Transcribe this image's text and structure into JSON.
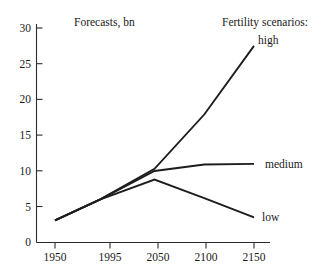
{
  "chart_data": {
    "type": "line",
    "title": "Forecasts, bn",
    "subtitle": "",
    "xlabel": "",
    "ylabel": "",
    "legend_heading": "Fertility scenarios:",
    "legend_position": "right-inline",
    "grid": false,
    "x": [
      1950,
      1995,
      2050,
      2100,
      2150
    ],
    "xlim": [
      1950,
      2150
    ],
    "ylim": [
      0,
      30
    ],
    "x_ticks": [
      1950,
      1995,
      2050,
      2100,
      2150
    ],
    "x_tick_labels": [
      "1950",
      "1995",
      "2050",
      "2100",
      "2150"
    ],
    "y_ticks": [
      0,
      5,
      10,
      15,
      20,
      25,
      30
    ],
    "y_tick_labels": [
      "0",
      "5",
      "10",
      "15",
      "20",
      "25",
      "30"
    ],
    "series": [
      {
        "name": "high",
        "label": "high",
        "color": "#1d1d1d",
        "x": [
          1950,
          1995,
          2050,
          2100,
          2150
        ],
        "values": [
          3.1,
          6.0,
          10.3,
          17.9,
          27.5
        ]
      },
      {
        "name": "medium",
        "label": "medium",
        "color": "#1d1d1d",
        "x": [
          1950,
          1995,
          2050,
          2100,
          2150
        ],
        "values": [
          3.1,
          6.0,
          10.0,
          10.9,
          11.0
        ]
      },
      {
        "name": "low",
        "label": "low",
        "color": "#1d1d1d",
        "x": [
          1950,
          1995,
          2050,
          2100,
          2150
        ],
        "values": [
          3.1,
          6.0,
          8.8,
          6.2,
          3.5
        ]
      }
    ],
    "annotations": [
      {
        "text": "Forecasts, bn",
        "kind": "title"
      },
      {
        "text": "Fertility scenarios:",
        "kind": "legend-heading"
      }
    ]
  },
  "labels": {
    "title": "Forecasts, bn",
    "legend_heading": "Fertility scenarios:",
    "series_high": "high",
    "series_medium": "medium",
    "series_low": "low",
    "y_0": "0",
    "y_5": "5",
    "y_10": "10",
    "y_15": "15",
    "y_20": "20",
    "y_25": "25",
    "y_30": "30",
    "x_1950": "1950",
    "x_1995": "1995",
    "x_2050": "2050",
    "x_2100": "2100",
    "x_2150": "2150"
  },
  "colors": {
    "background": "#ffffff",
    "ink": "#1a1a1a",
    "line": "#1d1d1d",
    "axis": "#2b2b2b"
  }
}
